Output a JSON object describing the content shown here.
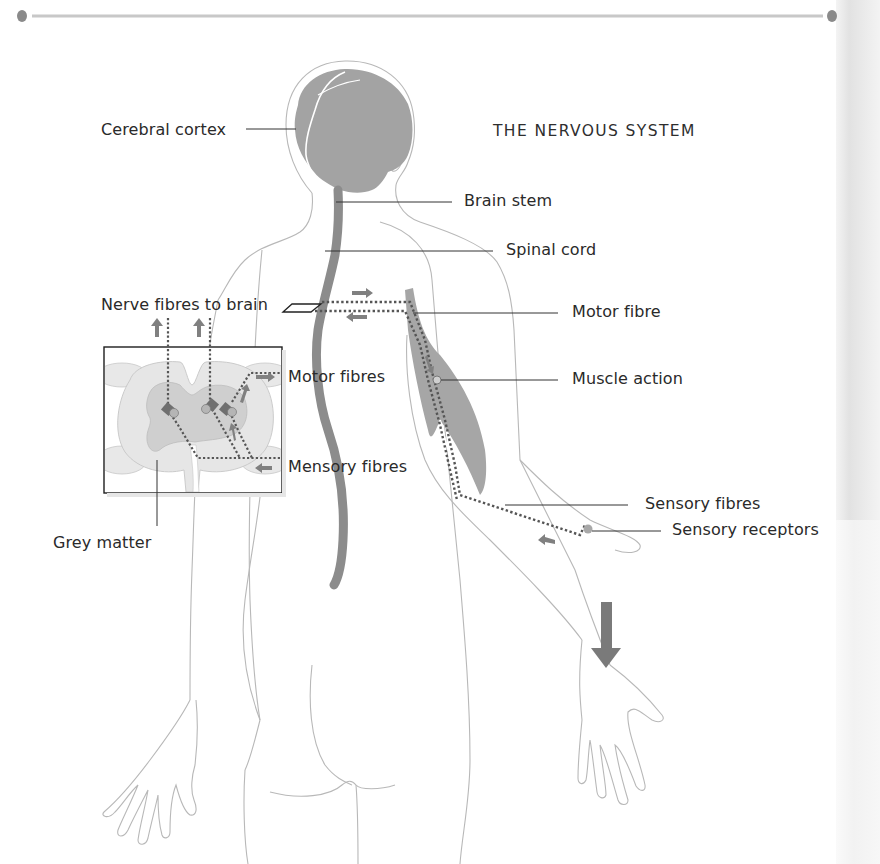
{
  "title": "THE NERVOUS SYSTEM",
  "labels": {
    "cerebral_cortex": "Cerebral cortex",
    "brain_stem": "Brain stem",
    "spinal_cord": "Spinal cord",
    "nerve_fibres_to_brain": "Nerve fibres to brain",
    "motor_fibre": "Motor fibre",
    "motor_fibres": "Motor fibres",
    "muscle_action": "Muscle action",
    "mensory_fibres": "Mensory fibres",
    "sensory_fibres": "Sensory fibres",
    "sensory_receptors": "Sensory receptors",
    "grey_matter": "Grey matter"
  },
  "colors": {
    "nerve_grey": "#8c8c8c",
    "brain_grey": "#a3a3a3",
    "muscle_grey": "#a6a6a6",
    "outline": "#b5b5b5",
    "white_matter": "#e6e6e6",
    "grey_matter": "#cfcfcf",
    "fibre_dots": "#555555",
    "arrow": "#7a7a7a",
    "text": "#2a2a2a"
  },
  "icons": {
    "direction_arrow": "down-arrow-icon"
  }
}
